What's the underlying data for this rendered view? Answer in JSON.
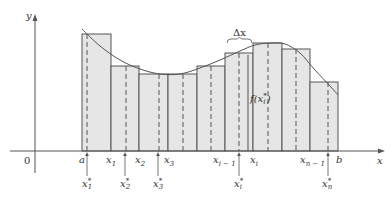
{
  "diagram": {
    "axes": {
      "x_label": "x",
      "y_label": "y",
      "origin_label": "0",
      "origin_px": [
        35,
        151
      ],
      "x_axis_px": [
        10,
        385
      ],
      "y_axis_px": [
        14,
        173
      ]
    },
    "colors": {
      "axis": "#555555",
      "rect_fill": "#e6e6e6",
      "rect_stroke": "#555555",
      "curve": "#555555",
      "dashed": "#555555",
      "text": "#333333"
    },
    "partition_px": [
      82,
      111,
      139,
      168,
      197,
      225,
      253,
      282,
      310,
      338
    ],
    "rect_tops_px": [
      34,
      66,
      74,
      74,
      66,
      53,
      43,
      49,
      82
    ],
    "sample_points_px": [
      87,
      126,
      159,
      183,
      211,
      239,
      268,
      296,
      328
    ],
    "curve_points_px": [
      [
        82,
        29
      ],
      [
        100,
        46
      ],
      [
        120,
        60
      ],
      [
        140,
        69
      ],
      [
        160,
        74
      ],
      [
        180,
        74
      ],
      [
        200,
        68
      ],
      [
        220,
        60
      ],
      [
        240,
        51
      ],
      [
        255,
        45
      ],
      [
        270,
        43
      ],
      [
        285,
        44
      ],
      [
        300,
        53
      ],
      [
        315,
        70
      ],
      [
        330,
        86
      ],
      [
        338,
        95
      ]
    ],
    "partition_labels": [
      {
        "text": "a",
        "sub": "",
        "x": 79,
        "y": 155
      },
      {
        "text": "x",
        "sub": "1",
        "x": 106,
        "y": 155
      },
      {
        "text": "x",
        "sub": "2",
        "x": 135,
        "y": 155
      },
      {
        "text": "x",
        "sub": "3",
        "x": 164,
        "y": 155
      },
      {
        "text": "x",
        "sub": "i − 1",
        "x": 213,
        "y": 155
      },
      {
        "text": "x",
        "sub": "i",
        "x": 250,
        "y": 155
      },
      {
        "text": "x",
        "sub": "n − 1",
        "x": 300,
        "y": 155
      },
      {
        "text": "b",
        "sub": "",
        "x": 336,
        "y": 155
      }
    ],
    "sample_labels": [
      {
        "text": "x",
        "sub": "1",
        "sup": "*",
        "x": 82,
        "y": 178,
        "arrow_x": 87
      },
      {
        "text": "x",
        "sub": "2",
        "sup": "*",
        "x": 120,
        "y": 178,
        "arrow_x": 125
      },
      {
        "text": "x",
        "sub": "3",
        "sup": "*",
        "x": 153,
        "y": 178,
        "arrow_x": 158
      },
      {
        "text": "x",
        "sub": "i",
        "sup": "*",
        "x": 234,
        "y": 178,
        "arrow_x": 239
      },
      {
        "text": "x",
        "sub": "n",
        "sup": "*",
        "x": 322,
        "y": 178,
        "arrow_x": 328
      }
    ],
    "delta_x": {
      "label": "Δx",
      "brace_from": 227,
      "brace_to": 252,
      "brace_y": 43,
      "label_x": 233,
      "label_y": 28
    },
    "f_label": {
      "text": "f(x",
      "sub": "i",
      "sup": "*",
      "close": ")",
      "x": 250,
      "y": 93,
      "leader_x": 248,
      "leader_top": 55,
      "leader_bottom": 151
    }
  }
}
